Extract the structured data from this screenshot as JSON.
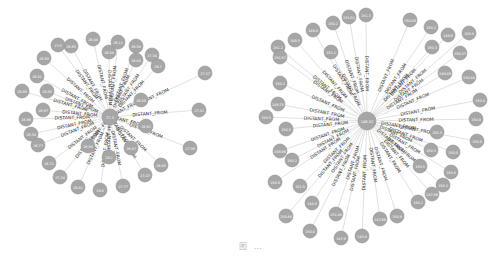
{
  "figure": {
    "caption": "图 …",
    "colors": {
      "node_fill": "#a6a6a6",
      "node_stroke": "#939393",
      "edge": "#d9d9d9",
      "edge_label": "#333333",
      "node_text": "#ffffff",
      "background": "#ffffff"
    },
    "relationship_label": "DISTANT_FROM"
  },
  "graphs": [
    {
      "name": "left-graph",
      "center": {
        "label": "27.5",
        "x": 110,
        "y": 117,
        "r": 8
      },
      "node_radius": 7,
      "nodes": [
        {
          "label": "26.44",
          "x": 93,
          "y": 39
        },
        {
          "label": "27.5",
          "x": 58,
          "y": 45
        },
        {
          "label": "26.65",
          "x": 71,
          "y": 46
        },
        {
          "label": "26.11",
          "x": 118,
          "y": 42
        },
        {
          "label": "26.58",
          "x": 109,
          "y": 52
        },
        {
          "label": "26.58",
          "x": 136,
          "y": 46
        },
        {
          "label": "26.59",
          "x": 44,
          "y": 58
        },
        {
          "label": "27.34",
          "x": 152,
          "y": 55
        },
        {
          "label": "26.84",
          "x": 136,
          "y": 60
        },
        {
          "label": "26.7",
          "x": 158,
          "y": 66
        },
        {
          "label": "27.37",
          "x": 205,
          "y": 73
        },
        {
          "label": "26.41",
          "x": 37,
          "y": 76
        },
        {
          "label": "26.99",
          "x": 22,
          "y": 91
        },
        {
          "label": "26.85",
          "x": 47,
          "y": 91
        },
        {
          "label": "26.97",
          "x": 43,
          "y": 110
        },
        {
          "label": "26.89",
          "x": 141,
          "y": 100
        },
        {
          "label": "27.32",
          "x": 199,
          "y": 110
        },
        {
          "label": "26.96",
          "x": 26,
          "y": 119
        },
        {
          "label": "26.92",
          "x": 146,
          "y": 126
        },
        {
          "label": "26.34",
          "x": 31,
          "y": 134
        },
        {
          "label": "26.77",
          "x": 38,
          "y": 145
        },
        {
          "label": "26.88",
          "x": 88,
          "y": 146
        },
        {
          "label": "26.87",
          "x": 131,
          "y": 148
        },
        {
          "label": "27.36",
          "x": 190,
          "y": 148
        },
        {
          "label": "26.2",
          "x": 109,
          "y": 157
        },
        {
          "label": "26.71",
          "x": 49,
          "y": 163
        },
        {
          "label": "26.85",
          "x": 161,
          "y": 165
        },
        {
          "label": "27.07",
          "x": 145,
          "y": 175
        },
        {
          "label": "27.34",
          "x": 60,
          "y": 177
        },
        {
          "label": "26.41",
          "x": 78,
          "y": 187
        },
        {
          "label": "26.6",
          "x": 100,
          "y": 190
        },
        {
          "label": "27.77",
          "x": 123,
          "y": 186
        }
      ]
    },
    {
      "name": "right-graph",
      "center": {
        "label": "149.52",
        "x": 367,
        "y": 121,
        "r": 9
      },
      "node_radius": 7,
      "nodes": [
        {
          "label": "151.3",
          "x": 366,
          "y": 15
        },
        {
          "label": "151.51",
          "x": 349,
          "y": 17
        },
        {
          "label": "150.09",
          "x": 410,
          "y": 20
        },
        {
          "label": "150.2",
          "x": 333,
          "y": 23
        },
        {
          "label": "150.2",
          "x": 431,
          "y": 27
        },
        {
          "label": "149.8",
          "x": 313,
          "y": 30
        },
        {
          "label": "149.6",
          "x": 448,
          "y": 35
        },
        {
          "label": "150.9",
          "x": 469,
          "y": 33
        },
        {
          "label": "149.5",
          "x": 295,
          "y": 40
        },
        {
          "label": "150.3",
          "x": 432,
          "y": 47
        },
        {
          "label": "151.2",
          "x": 278,
          "y": 47
        },
        {
          "label": "151.2",
          "x": 331,
          "y": 52
        },
        {
          "label": "150.37",
          "x": 460,
          "y": 53
        },
        {
          "label": "151.57",
          "x": 280,
          "y": 57
        },
        {
          "label": "149.49",
          "x": 445,
          "y": 73
        },
        {
          "label": "150.44",
          "x": 469,
          "y": 77
        },
        {
          "label": "150.2",
          "x": 280,
          "y": 83
        },
        {
          "label": "150.0",
          "x": 480,
          "y": 100
        },
        {
          "label": "149.75",
          "x": 278,
          "y": 104
        },
        {
          "label": "150.5",
          "x": 266,
          "y": 117
        },
        {
          "label": "150.0",
          "x": 476,
          "y": 119
        },
        {
          "label": "150.0",
          "x": 286,
          "y": 129
        },
        {
          "label": "150.3",
          "x": 437,
          "y": 132
        },
        {
          "label": "150.9",
          "x": 477,
          "y": 141
        },
        {
          "label": "149.96",
          "x": 280,
          "y": 151
        },
        {
          "label": "150.3",
          "x": 431,
          "y": 150
        },
        {
          "label": "150.0",
          "x": 453,
          "y": 152
        },
        {
          "label": "150.2",
          "x": 292,
          "y": 160
        },
        {
          "label": "150.5",
          "x": 420,
          "y": 166
        },
        {
          "label": "150.8",
          "x": 451,
          "y": 172
        },
        {
          "label": "150.9",
          "x": 275,
          "y": 182
        },
        {
          "label": "151.5",
          "x": 300,
          "y": 186
        },
        {
          "label": "150.2",
          "x": 443,
          "y": 185
        },
        {
          "label": "147.96",
          "x": 432,
          "y": 194
        },
        {
          "label": "148.8",
          "x": 312,
          "y": 203
        },
        {
          "label": "150.2",
          "x": 418,
          "y": 202
        },
        {
          "label": "150.86",
          "x": 286,
          "y": 216
        },
        {
          "label": "151.44",
          "x": 336,
          "y": 214
        },
        {
          "label": "147.66",
          "x": 380,
          "y": 219
        },
        {
          "label": "150.8",
          "x": 397,
          "y": 216
        },
        {
          "label": "150.0",
          "x": 310,
          "y": 231
        },
        {
          "label": "147.9",
          "x": 341,
          "y": 238
        },
        {
          "label": "148.8",
          "x": 362,
          "y": 236
        }
      ]
    }
  ]
}
